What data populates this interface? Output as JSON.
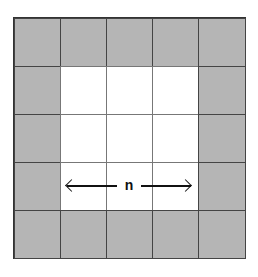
{
  "diagram": {
    "rows": 5,
    "cols": 5,
    "colors": {
      "shaded": "#b5b5b5",
      "open": "#ffffff",
      "line": "#333333"
    },
    "cells": [
      [
        "shaded",
        "shaded",
        "shaded",
        "shaded",
        "shaded"
      ],
      [
        "shaded",
        "open",
        "open",
        "open",
        "shaded"
      ],
      [
        "shaded",
        "open",
        "open",
        "open",
        "shaded"
      ],
      [
        "shaded",
        "open",
        "open",
        "open",
        "shaded"
      ],
      [
        "shaded",
        "shaded",
        "shaded",
        "shaded",
        "shaded"
      ]
    ],
    "dimension_label": "n",
    "dimension_arrow": "double-headed horizontal"
  }
}
